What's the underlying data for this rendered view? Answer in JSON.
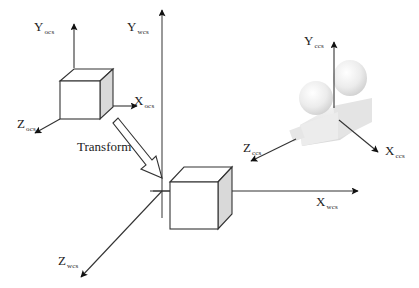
{
  "diagram": {
    "title": "",
    "colors": {
      "line": "#333333",
      "arrowhead": "#111111",
      "cube_side": "#d9d9d9",
      "cube_face": "#ffffff",
      "camera_light": "#f2f2f2",
      "camera_mid": "#dcdcdc",
      "camera_dark": "#c4c4c4"
    },
    "object_frame": {
      "y_label": "Y",
      "y_sub": "ocs",
      "x_label": "X",
      "x_sub": "ocs",
      "z_label": "Z",
      "z_sub": "ocs"
    },
    "world_frame": {
      "y_label": "Y",
      "y_sub": "wcs",
      "x_label": "X",
      "x_sub": "wcs",
      "z_label": "Z",
      "z_sub": "wcs"
    },
    "camera_frame": {
      "y_label": "Y",
      "y_sub": "ccs",
      "x_label": "X",
      "x_sub": "ccs",
      "z_label": "Z",
      "z_sub": "ccs"
    },
    "transform_label": "Transform"
  }
}
